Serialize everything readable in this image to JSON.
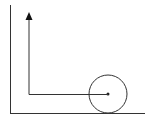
{
  "diagram": {
    "colors": {
      "stroke": "#333333",
      "background": "#ffffff"
    },
    "wall": {
      "x": 10.5,
      "y1": 5,
      "y2": 113
    },
    "floor": {
      "y": 113.5,
      "x1": 10,
      "x2": 145
    },
    "ball": {
      "cx": 108,
      "cy": 94,
      "r": 19
    },
    "center_dot": {
      "cx": 108,
      "cy": 94,
      "r": 1.5
    },
    "path": {
      "points": "108,94.5 29,94.5 29,18"
    },
    "arrow_head": {
      "points": "29,12 25.5,20 32.5,20"
    }
  }
}
